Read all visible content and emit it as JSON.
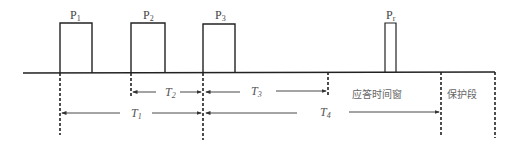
{
  "diagram": {
    "type": "pulse-timing",
    "baseline": {
      "x1": 23,
      "x2": 495,
      "y": 73
    },
    "pulses": [
      {
        "id": "P1",
        "label": "P",
        "sub": "1",
        "x": 60,
        "width": 32,
        "top": 23
      },
      {
        "id": "P2",
        "label": "P",
        "sub": "2",
        "x": 131,
        "width": 34,
        "top": 23
      },
      {
        "id": "P3",
        "label": "P",
        "sub": "3",
        "x": 203,
        "width": 32,
        "top": 23
      },
      {
        "id": "Pr",
        "label": "P",
        "sub": "r",
        "x": 385,
        "width": 11,
        "top": 23
      }
    ],
    "markers": [
      {
        "x": 60,
        "y2": 135
      },
      {
        "x": 131,
        "y2": 96
      },
      {
        "x": 203,
        "y2": 140
      },
      {
        "x": 328,
        "y2": 96
      },
      {
        "x": 441,
        "y2": 135
      },
      {
        "x": 495,
        "y2": 138
      }
    ],
    "intervals": [
      {
        "id": "T2",
        "label": "T",
        "sub": "2",
        "from": 131,
        "to": 203,
        "y": 92
      },
      {
        "id": "T3",
        "label": "T",
        "sub": "3",
        "from": 203,
        "to": 328,
        "y": 92
      },
      {
        "id": "T1",
        "label": "T",
        "sub": "1",
        "from": 60,
        "to": 203,
        "y": 113
      },
      {
        "id": "T4",
        "label": "T",
        "sub": "4",
        "from": 203,
        "to": 441,
        "y": 113
      }
    ],
    "regions": {
      "response_window": "应答时间窗",
      "guard_segment": "保护段"
    }
  }
}
